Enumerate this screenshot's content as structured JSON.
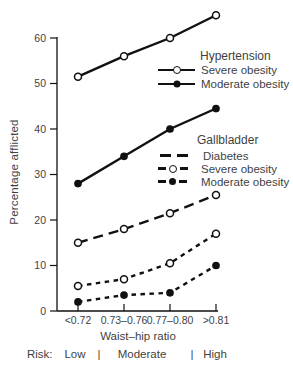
{
  "chart_data": {
    "type": "line",
    "title": "",
    "xlabel": "Waist–hip ratio",
    "ylabel": "Percentage afflicted",
    "categories": [
      "<0.72",
      "0.73–0.76",
      "0.77–0.80",
      ">0.81"
    ],
    "ylim": [
      0,
      60
    ],
    "yticks": [
      0,
      10,
      20,
      30,
      40,
      50,
      60
    ],
    "grid": false,
    "legend_position": "right-inside",
    "series": [
      {
        "name": "Hypertension – Severe obesity",
        "group": "Hypertension",
        "label": "Severe obesity",
        "line": "solid",
        "marker": "open-circle",
        "values": [
          51.5,
          56,
          60,
          65
        ]
      },
      {
        "name": "Hypertension – Moderate obesity",
        "group": "Hypertension",
        "label": "Moderate obesity",
        "line": "solid",
        "marker": "filled-circle",
        "values": [
          28,
          34,
          40,
          44.5
        ]
      },
      {
        "name": "Gallbladder – Diabetes",
        "group": "Gallbladder",
        "label": "Diabetes",
        "line": "long-dash",
        "marker": "open-circle",
        "values": [
          15,
          18,
          21.5,
          25.5
        ]
      },
      {
        "name": "Gallbladder – Severe obesity",
        "group": "Gallbladder",
        "label": "Severe obesity",
        "line": "short-dash",
        "marker": "open-circle",
        "values": [
          5.5,
          7,
          10.5,
          17
        ]
      },
      {
        "name": "Gallbladder – Moderate obesity",
        "group": "Gallbladder",
        "label": "Moderate obesity",
        "line": "short-dash",
        "marker": "filled-circle",
        "values": [
          2,
          3.5,
          4,
          10
        ]
      }
    ],
    "legend": {
      "groups": [
        {
          "header": "Hypertension",
          "items": [
            {
              "label": "Severe obesity",
              "line": "solid",
              "marker": "open-circle"
            },
            {
              "label": "Moderate obesity",
              "line": "solid",
              "marker": "filled-circle"
            }
          ]
        },
        {
          "header": "Gallbladder",
          "items": [
            {
              "label": "Diabetes",
              "line": "long-dash",
              "marker": "none"
            },
            {
              "label": "Severe obesity",
              "line": "short-dash",
              "marker": "open-circle"
            },
            {
              "label": "Moderate obesity",
              "line": "short-dash",
              "marker": "filled-circle"
            }
          ]
        }
      ]
    }
  },
  "risk_scale": {
    "label": "Risk:",
    "zones": [
      "Low",
      "Moderate",
      "High"
    ],
    "separator": "|"
  },
  "colors": {
    "line": "#111111",
    "text": "#3f3f3f",
    "background": "#ffffff"
  }
}
